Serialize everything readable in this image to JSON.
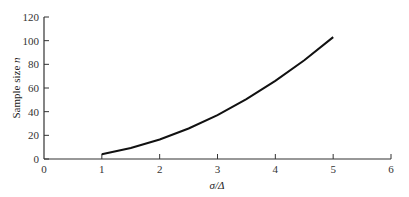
{
  "chart_data": {
    "type": "line",
    "title": "",
    "xlabel": "σ/Δ",
    "ylabel_prefix": "Sample size ",
    "ylabel_var": "n",
    "xlim": [
      0,
      6
    ],
    "ylim": [
      0,
      120
    ],
    "grid": false,
    "legend": null,
    "x_ticks": [
      "0",
      "1",
      "2",
      "3",
      "4",
      "5",
      "6"
    ],
    "y_ticks": [
      "0",
      "20",
      "40",
      "60",
      "80",
      "100",
      "120"
    ],
    "series": [
      {
        "name": "n vs σ/Δ",
        "x": [
          1,
          1.5,
          2,
          2.5,
          3,
          3.5,
          4,
          4.5,
          5
        ],
        "y": [
          4,
          9.3,
          16.5,
          25.8,
          37,
          50.5,
          66,
          83.5,
          103
        ]
      }
    ]
  }
}
